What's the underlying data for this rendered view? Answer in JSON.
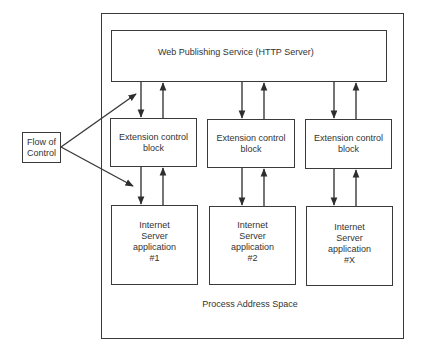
{
  "diagram": {
    "outer_container": {
      "label": "Process Address Space"
    },
    "server": {
      "label": "Web Publishing Service (HTTP Server)"
    },
    "flow_of_control": {
      "label_line1": "Flow of",
      "label_line2": "Control"
    },
    "columns": [
      {
        "ecb": {
          "line1": "Extension control",
          "line2": "block"
        },
        "app": {
          "line1": "Internet",
          "line2": "Server",
          "line3": "application",
          "line4": "#1"
        }
      },
      {
        "ecb": {
          "line1": "Extension control",
          "line2": "block"
        },
        "app": {
          "line1": "Internet",
          "line2": "Server",
          "line3": "application",
          "line4": "#2"
        }
      },
      {
        "ecb": {
          "line1": "Extension control",
          "line2": "block"
        },
        "app": {
          "line1": "Internet",
          "line2": "Server",
          "line3": "application",
          "line4": "#X"
        }
      }
    ],
    "colors": {
      "line": "#3a3a3a",
      "text": "#333333",
      "background": "#ffffff"
    }
  }
}
